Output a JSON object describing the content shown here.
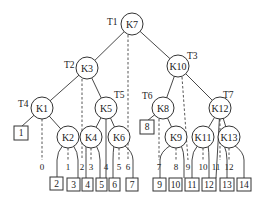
{
  "diagram": {
    "type": "binary search tree with dummy leaves",
    "nodes": [
      {
        "id": "K7",
        "label": "K7",
        "tag": "T1",
        "x": 132,
        "y": 24
      },
      {
        "id": "K3",
        "label": "K3",
        "tag": "T2",
        "x": 87,
        "y": 68
      },
      {
        "id": "K10",
        "label": "K10",
        "tag": "T3",
        "x": 178,
        "y": 66
      },
      {
        "id": "K1",
        "label": "K1",
        "tag": "T4",
        "x": 42,
        "y": 108
      },
      {
        "id": "K5",
        "label": "K5",
        "tag": "T5",
        "x": 106,
        "y": 108
      },
      {
        "id": "K8",
        "label": "K8",
        "tag": "T6",
        "x": 163,
        "y": 108
      },
      {
        "id": "K12",
        "label": "K12",
        "tag": "T7",
        "x": 220,
        "y": 108
      },
      {
        "id": "K2",
        "label": "K2",
        "x": 68,
        "y": 137
      },
      {
        "id": "K4",
        "label": "K4",
        "x": 91,
        "y": 137
      },
      {
        "id": "K6",
        "label": "K6",
        "x": 119,
        "y": 137
      },
      {
        "id": "K9",
        "label": "K9",
        "x": 176,
        "y": 137
      },
      {
        "id": "K11",
        "label": "K11",
        "x": 203,
        "y": 137
      },
      {
        "id": "K13",
        "label": "K13",
        "x": 229,
        "y": 137
      }
    ],
    "tags": {
      "T1": "T1",
      "T2": "T2",
      "T3": "T3",
      "T4": "T4",
      "T5": "T5",
      "T6": "T6",
      "T7": "T7"
    },
    "leaves": [
      {
        "label": "1",
        "x": 21,
        "y": 133
      },
      {
        "label": "8",
        "x": 147,
        "y": 127
      },
      {
        "label": "2",
        "x": 56,
        "y": 183
      },
      {
        "label": "3",
        "x": 73,
        "y": 184
      },
      {
        "label": "4",
        "x": 88,
        "y": 184
      },
      {
        "label": "5",
        "x": 102,
        "y": 184
      },
      {
        "label": "6",
        "x": 115,
        "y": 184
      },
      {
        "label": "7",
        "x": 132,
        "y": 184
      },
      {
        "label": "9",
        "x": 160,
        "y": 184
      },
      {
        "label": "10",
        "x": 175,
        "y": 184
      },
      {
        "label": "11",
        "x": 192,
        "y": 184
      },
      {
        "label": "12",
        "x": 209,
        "y": 184
      },
      {
        "label": "13",
        "x": 227,
        "y": 184
      },
      {
        "label": "14",
        "x": 244,
        "y": 184
      }
    ],
    "pointers": [
      "0",
      "1",
      "2",
      "3",
      "4",
      "5",
      "6",
      "7",
      "8",
      "9",
      "10",
      "11",
      "12"
    ]
  }
}
